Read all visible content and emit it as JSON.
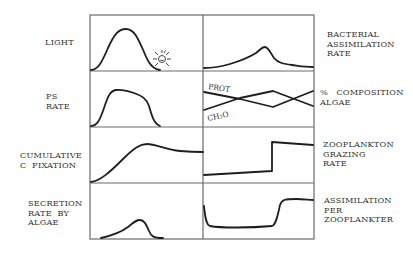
{
  "left_labels": [
    {
      "id": "light",
      "text": "LIGHT"
    },
    {
      "id": "ps_rate",
      "text": "PS\nRATE"
    },
    {
      "id": "cum_c_fix",
      "text": "CUMULATIVE\nC  FIXATION"
    },
    {
      "id": "secretion",
      "text": "SECRETION\nRATE  BY\nALGAE"
    }
  ],
  "right_labels": [
    {
      "id": "bact_assim",
      "text": "BACTERIAL\nASSIMILATION\nRATE"
    },
    {
      "id": "composition",
      "text": "%   COMPOSITION\nALGAE"
    },
    {
      "id": "grazing",
      "text": "ZOOPLANKTON\nGRAZING\nRATE"
    },
    {
      "id": "assim_per",
      "text": "ASSIMILATION\nPER\nZOOPLANKTER"
    }
  ],
  "inline_labels": {
    "prot": "PROT",
    "ch2o": "CH₂O"
  },
  "icons": {
    "sun": "smiling-sun"
  },
  "layout": {
    "grid_left": 90,
    "grid_mid": 203,
    "grid_right": 314,
    "row_edges": [
      15,
      71,
      127,
      183,
      239
    ]
  }
}
